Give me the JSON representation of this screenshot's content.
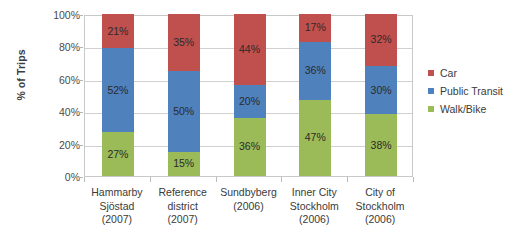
{
  "chart_data": {
    "type": "bar",
    "subtype": "100% stacked bar",
    "title": "",
    "xlabel": "",
    "ylabel": "% of Trips",
    "ylim": [
      0,
      100
    ],
    "yticks": [
      "0%",
      "20%",
      "40%",
      "60%",
      "80%",
      "100%"
    ],
    "ytick_values": [
      0,
      20,
      40,
      60,
      80,
      100
    ],
    "grid": "horizontal",
    "legend_position": "right",
    "categories": [
      "Hammarby Sjöstad (2007)",
      "Reference district (2007)",
      "Sundbyberg (2006)",
      "Inner City Stockholm (2006)",
      "City of Stockholm (2006)"
    ],
    "category_lines": [
      [
        "Hammarby",
        "Sjöstad",
        "(2007)"
      ],
      [
        "Reference",
        "district",
        "(2007)"
      ],
      [
        "Sundbyberg",
        "(2006)"
      ],
      [
        "Inner City",
        "Stockholm",
        "(2006)"
      ],
      [
        "City of",
        "Stockholm",
        "(2006)"
      ]
    ],
    "series": [
      {
        "name": "Walk/Bike",
        "color": "#9BBB59",
        "values": [
          27,
          15,
          36,
          47,
          38
        ],
        "labels": [
          "27%",
          "15%",
          "36%",
          "47%",
          "38%"
        ]
      },
      {
        "name": "Public Transit",
        "color": "#4F81BD",
        "values": [
          52,
          50,
          20,
          36,
          30
        ],
        "labels": [
          "52%",
          "50%",
          "20%",
          "36%",
          "30%"
        ]
      },
      {
        "name": "Car",
        "color": "#C0504D",
        "values": [
          21,
          35,
          44,
          17,
          32
        ],
        "labels": [
          "21%",
          "35%",
          "44%",
          "17%",
          "32%"
        ]
      }
    ],
    "legend_entries": [
      {
        "label": "Car",
        "color": "#C0504D"
      },
      {
        "label": "Public Transit",
        "color": "#4F81BD"
      },
      {
        "label": "Walk/Bike",
        "color": "#9BBB59"
      }
    ]
  }
}
